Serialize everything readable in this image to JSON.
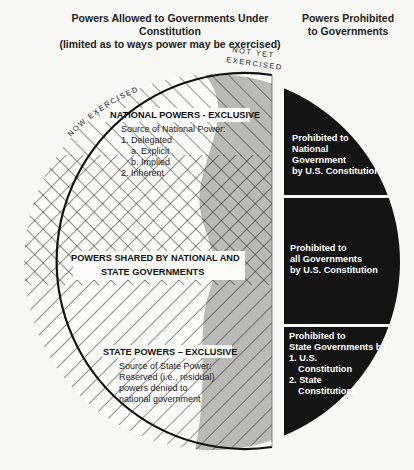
{
  "headers": {
    "allowed_line1": "Powers Allowed to Governments Under Constitution",
    "allowed_line2": "(limited as to ways power may be exercised)",
    "prohibited_line1": "Powers Prohibited",
    "prohibited_line2": "to Governments"
  },
  "arc_labels": {
    "now_exercised": "NOW EXERCISED",
    "not_yet_line1": "NOT YET",
    "not_yet_line2": "EXERCISED"
  },
  "national": {
    "title": "NATIONAL POWERS - EXCLUSIVE",
    "source": "Source of National Power:",
    "items": [
      "1.  Delegated",
      "a.  Explicit",
      "b.  Implied",
      "2.  Inherent"
    ]
  },
  "shared": {
    "line1": "POWERS SHARED BY NATIONAL AND",
    "line2": "STATE GOVERNMENTS"
  },
  "state": {
    "title": "STATE POWERS – EXCLUSIVE",
    "lines": [
      "Source of State Power:",
      "Reserved (i.e., residual)",
      "powers denied to",
      "national government"
    ]
  },
  "prohibited": [
    {
      "lines": [
        "Prohibited to",
        "National",
        "Government",
        "by U.S. Constitution"
      ]
    },
    {
      "lines": [
        "Prohibited to",
        "all Governments",
        "by U.S. Constitution"
      ]
    },
    {
      "lines": [
        "Prohibited to",
        "State Governments by",
        "1. U.S.",
        "Constitution",
        "2. State",
        "Constitutions"
      ]
    }
  ],
  "colors": {
    "outline": "#111111",
    "hatch": "#222222",
    "gray_band": "#b9b9b6",
    "dark_band": "#141414",
    "background": "#f7f7f5"
  }
}
